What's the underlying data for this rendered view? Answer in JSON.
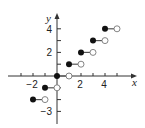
{
  "chart_data": {
    "type": "scatter",
    "title": "",
    "subtitle": "",
    "xlabel": "x",
    "ylabel": "y",
    "xlim": [
      -4,
      6.5
    ],
    "ylim": [
      -4,
      4.8
    ],
    "grid": false,
    "legend": null,
    "function": "floor(x) step function",
    "x_tick_labels": [
      "-2",
      "2",
      "4"
    ],
    "y_tick_labels": [
      "4",
      "2",
      "-3"
    ],
    "x_ticks": [
      -3,
      -2,
      -1,
      1,
      2,
      3,
      4,
      5
    ],
    "y_ticks": [
      -3,
      -2,
      -1,
      1,
      2,
      3,
      4
    ],
    "segments": [
      {
        "x_start": -2,
        "x_end": -1,
        "y": -2,
        "closed_start": true,
        "open_end": true
      },
      {
        "x_start": -1,
        "x_end": 0,
        "y": -1,
        "closed_start": true,
        "open_end": true
      },
      {
        "x_start": 0,
        "x_end": 1,
        "y": 0,
        "closed_start": true,
        "open_end": true
      },
      {
        "x_start": 1,
        "x_end": 2,
        "y": 1,
        "closed_start": true,
        "open_end": true
      },
      {
        "x_start": 2,
        "x_end": 3,
        "y": 2,
        "closed_start": true,
        "open_end": true
      },
      {
        "x_start": 3,
        "x_end": 4,
        "y": 3,
        "closed_start": true,
        "open_end": true
      },
      {
        "x_start": 4,
        "x_end": 5,
        "y": 4,
        "closed_start": true,
        "open_end": true
      }
    ]
  },
  "style": {
    "axis_color": "#333333",
    "segment_color": "#555555",
    "closed_fill": "#111111",
    "open_fill": "#ffffff"
  }
}
